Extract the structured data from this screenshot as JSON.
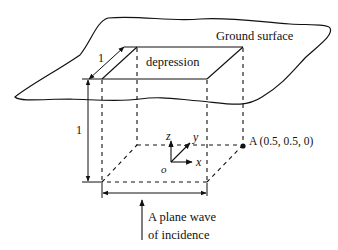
{
  "diagram": {
    "ground_label": "Ground surface",
    "depression_label": "depression",
    "depth_dim_label": "1",
    "height_dim_label": "1",
    "axes": {
      "z": "z",
      "y": "y",
      "x": "x",
      "origin": "o"
    },
    "point_label": "A (0.5, 0.5, 0)",
    "wave_label_line1": "A plane wave",
    "wave_label_line2": "of incidence"
  }
}
